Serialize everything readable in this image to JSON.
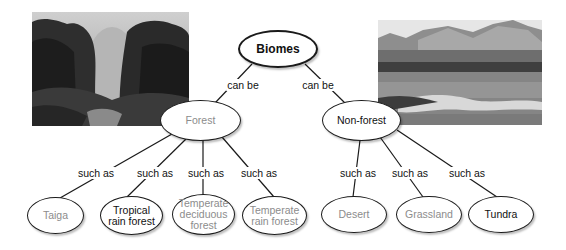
{
  "diagram": {
    "root": {
      "label": "Biomes"
    },
    "links_top": [
      "can be",
      "can be"
    ],
    "forest": {
      "label": "Forest",
      "link_label": "such as",
      "children": [
        {
          "label": "Taiga"
        },
        {
          "label": "Tropical rain forest"
        },
        {
          "label": "Temperate deciduous forest"
        },
        {
          "label": "Temperate rain forest"
        }
      ]
    },
    "nonforest": {
      "label": "Non-forest",
      "link_label": "such as",
      "children": [
        {
          "label": "Desert"
        },
        {
          "label": "Grassland"
        },
        {
          "label": "Tundra"
        }
      ]
    },
    "photos": {
      "left": "forest-photo",
      "right": "tundra-photo"
    }
  }
}
